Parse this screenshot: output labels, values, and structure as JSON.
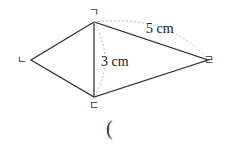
{
  "diagram": {
    "vertices": {
      "g": {
        "label": "ㄱ",
        "x": 94,
        "y": 22
      },
      "n": {
        "label": "ㄴ",
        "x": 31,
        "y": 60
      },
      "d": {
        "label": "ㄷ",
        "x": 94,
        "y": 97
      },
      "r": {
        "label": "ㄹ",
        "x": 208,
        "y": 60
      }
    },
    "measurements": {
      "side_gr": "5 cm",
      "side_gd": "3 cm"
    },
    "answer_blank": "("
  },
  "colors": {
    "line": "#333333",
    "dashed": "#bbbbbb"
  }
}
